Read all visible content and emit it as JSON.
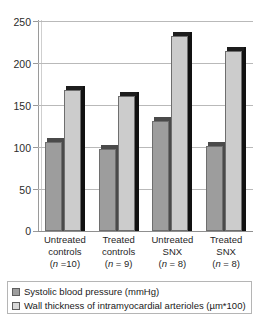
{
  "chart_data": {
    "type": "bar",
    "title": "",
    "subtitle": "",
    "xlabel": "",
    "ylabel": "",
    "ylim": [
      0,
      250
    ],
    "yticks": [
      0,
      50,
      100,
      150,
      200,
      250
    ],
    "ytick_labels": [
      "0",
      "50",
      "100",
      "150",
      "200",
      "250"
    ],
    "grid": true,
    "grid_axis": "y",
    "legend_position": "bottom",
    "style": "3d-bar",
    "categories": [
      "Untreated controls",
      "Treated controls",
      "Untreated SNX",
      "Treated SNX"
    ],
    "category_lines": [
      [
        "Untreated",
        "controls"
      ],
      [
        "Treated",
        "controls"
      ],
      [
        "Untreated",
        "SNX"
      ],
      [
        "Treated",
        "SNX"
      ]
    ],
    "group_n": [
      "(n =10)",
      "(n = 9)",
      "(n = 8)",
      "(n = 8)"
    ],
    "series": [
      {
        "name": "Systolic blood pressure (mmHg)",
        "color": "#9d9d9d",
        "values": [
          106,
          97,
          130,
          101
        ]
      },
      {
        "name": "Wall thickness of intramyocardial arterioles (µm*100)",
        "color": "#cccccc",
        "values": [
          167,
          160,
          231,
          213
        ]
      }
    ]
  },
  "axis": {
    "y_labels": [
      "250",
      "200",
      "150",
      "100",
      "50",
      "0"
    ]
  },
  "categories": [
    {
      "line1": "Untreated",
      "line2": "controls",
      "n_prefix": "(",
      "n_italic": "n",
      "n_value": " =10)"
    },
    {
      "line1": "Treated",
      "line2": "controls",
      "n_prefix": "(",
      "n_italic": "n",
      "n_value": " = 9)"
    },
    {
      "line1": "Untreated",
      "line2": "SNX",
      "n_prefix": "(",
      "n_italic": "n",
      "n_value": " = 8)"
    },
    {
      "line1": "Treated",
      "line2": "SNX",
      "n_prefix": "(",
      "n_italic": "n",
      "n_value": " = 8)"
    }
  ],
  "legend": {
    "items": [
      {
        "label": "Systolic blood pressure (mmHg)",
        "color": "#9d9d9d"
      },
      {
        "label": "Wall thickness of intramyocardial arterioles (µm*100)",
        "color": "#d8d8d8"
      }
    ]
  }
}
